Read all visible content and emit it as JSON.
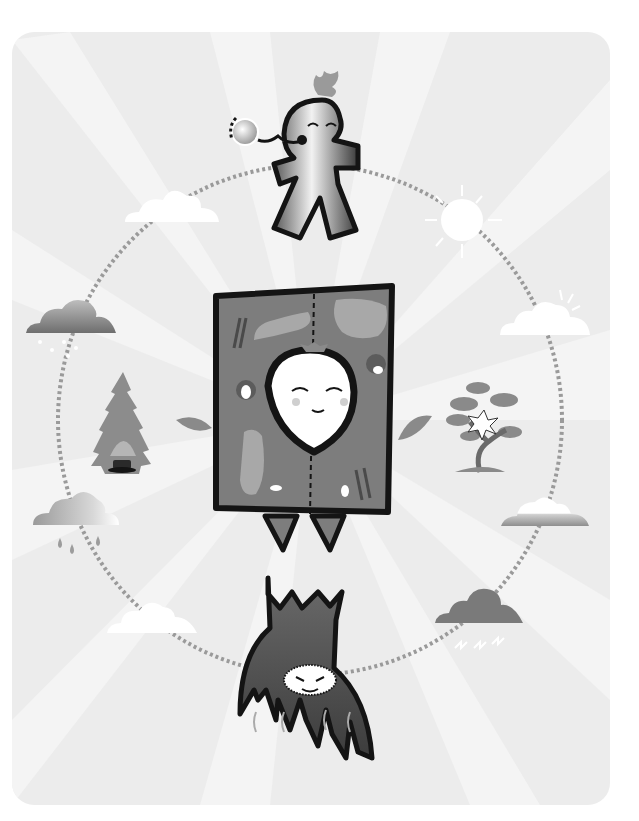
{
  "canvas": {
    "width": 639,
    "height": 821,
    "background": "#ffffff"
  },
  "panel": {
    "x": 12,
    "y": 32,
    "width": 598,
    "height": 773,
    "radius": 22,
    "fill": "#ececec",
    "ray_fill": "#f4f4f4"
  },
  "cycle_ring": {
    "cx": 310,
    "cy": 420,
    "rx": 252,
    "ry": 255,
    "stroke": "#9a9a9a",
    "style": "dotted"
  },
  "palette": {
    "outline": "#141414",
    "cell_fill": "#7d7d7d",
    "cell_organelle": "#a8a8a8",
    "leaf": "#8a8a8a",
    "root_fill": "#5e5e5e",
    "cloud_white": "#ffffff",
    "cloud_gray": "#8c8c8c",
    "storm_cloud": "#7a7a7a",
    "sun": "#ffffff"
  },
  "elements": [
    {
      "name": "sprout-character",
      "position": "top"
    },
    {
      "name": "sun-icon",
      "position": "upper-right"
    },
    {
      "name": "cloud-sunny-icon",
      "position": "right-upper"
    },
    {
      "name": "flowering-tree-icon",
      "position": "right"
    },
    {
      "name": "cloud-rainbow-icon",
      "position": "right-lower"
    },
    {
      "name": "storm-cloud-icon",
      "position": "lower-right"
    },
    {
      "name": "root-character",
      "position": "bottom"
    },
    {
      "name": "cloud-white-icon",
      "position": "lower-left"
    },
    {
      "name": "rain-cloud-icon",
      "position": "left-lower"
    },
    {
      "name": "pine-tree-icon",
      "position": "left"
    },
    {
      "name": "snow-cloud-icon",
      "position": "left-upper"
    },
    {
      "name": "cloud-white-icon",
      "position": "upper-left"
    },
    {
      "name": "plant-cell-character",
      "position": "center"
    }
  ]
}
